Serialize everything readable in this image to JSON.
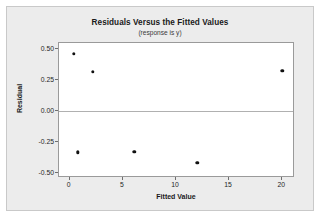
{
  "chart_data": {
    "type": "scatter",
    "title": "Residuals Versus the Fitted Values",
    "subtitle": "(response is y)",
    "xlabel": "Fitted Value",
    "ylabel": "Residual",
    "xlim": [
      -1.0,
      21.2
    ],
    "ylim": [
      -0.54,
      0.545
    ],
    "xticks": [
      0,
      5,
      10,
      15,
      20
    ],
    "xtick_labels": [
      "0",
      "5",
      "10",
      "15",
      "20"
    ],
    "yticks": [
      0.5,
      0.25,
      0,
      -0.25,
      -0.5
    ],
    "ytick_labels": [
      "0.50",
      "0.25",
      "0.00",
      "-0.25",
      "-0.50"
    ],
    "grid": false,
    "legend": null,
    "reference_lines": [
      {
        "axis": "y",
        "value": 0,
        "color": "#b0b0b0"
      }
    ],
    "marker": {
      "shape": "circle",
      "color": "#111111",
      "size": 3.4
    },
    "points": [
      {
        "x": 0.4,
        "y": 0.46
      },
      {
        "x": 2.2,
        "y": 0.315
      },
      {
        "x": 20.0,
        "y": 0.32
      },
      {
        "x": 0.75,
        "y": -0.335
      },
      {
        "x": 6.1,
        "y": -0.33
      },
      {
        "x": 12.0,
        "y": -0.42
      }
    ]
  },
  "colors": {
    "panel_background": "#ececec",
    "plot_background": "#ffffff",
    "frame_border": "#9a9a9a",
    "text": "#1a1a1a",
    "marker": "#111111",
    "reference_line": "#b0b0b0"
  }
}
